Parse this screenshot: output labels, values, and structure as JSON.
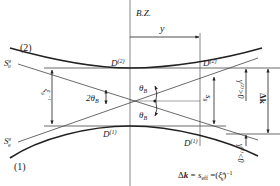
{
  "diagram": {
    "type": "dispersion-surface",
    "colors": {
      "line": "#222222",
      "axis": "#888888",
      "thin": "#444444"
    },
    "labels": {
      "bz": "B.Z.",
      "branch_upper": "(2)",
      "branch_lower": "(1)",
      "s0_base": "S",
      "s0_sup": "g",
      "s0_sub": "0",
      "sg_base": "S",
      "sg_sup": "g",
      "sg_sub": "g",
      "d2_left_base": "D",
      "d2_left_sup": "(2)",
      "d2_right_base": "D",
      "d2_right_sup": "(2)",
      "d1_left_base": "D",
      "d1_left_sup": "(1)",
      "d1_right_base": "D",
      "d1_right_sup": "(1)",
      "y": "y",
      "two_theta_b": "2θ",
      "two_theta_b_sub": "B",
      "theta_upper": "θ",
      "theta_upper_sub": "B",
      "theta_lower": "θ",
      "theta_lower_sub": "B",
      "xi_inv": "ξ",
      "xi_inv_sub": "g",
      "xi_inv_sup": "−1",
      "s_g": "s",
      "s_g_sub": "g",
      "gamma2": "γ",
      "gamma2_sup": "(2)",
      "gamma2_rel": ">0",
      "gamma1": "γ",
      "gamma1_sup": "(1)",
      "gamma1_rel": "<0",
      "delta_k": "Δk",
      "formula_lhs": "Δ",
      "formula_k": "k",
      "formula_eq1": " = ",
      "formula_s": "s",
      "formula_s_sub": "eff",
      "formula_eq2": " =(",
      "formula_xi": "ξ",
      "formula_xi_sub": "g",
      "formula_xi_sup": "π",
      "formula_close": ")",
      "formula_pow": "−1"
    }
  }
}
